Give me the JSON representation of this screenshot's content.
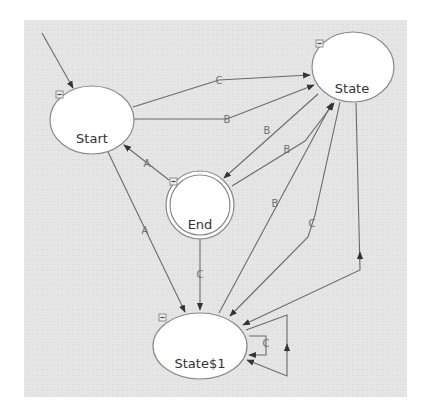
{
  "diagram": {
    "type": "state-machine",
    "colors": {
      "background": "#e6e6e6",
      "node_fill": "#ffffff",
      "node_stroke": "#8a8a8a",
      "edge": "#6a6a6a",
      "label": "#333333"
    },
    "nodes": [
      {
        "id": "start",
        "label": "Start",
        "kind": "initial",
        "collapse_icon": "minus-box-icon"
      },
      {
        "id": "state",
        "label": "State",
        "kind": "normal",
        "collapse_icon": "minus-box-icon"
      },
      {
        "id": "end",
        "label": "End",
        "kind": "final",
        "collapse_icon": "minus-box-icon"
      },
      {
        "id": "state1",
        "label": "State$1",
        "kind": "normal",
        "collapse_icon": "minus-box-icon"
      }
    ],
    "edges": [
      {
        "from": "start",
        "to": "state",
        "label": "C"
      },
      {
        "from": "start",
        "to": "state",
        "label": "B"
      },
      {
        "from": "state",
        "to": "end",
        "label": "B"
      },
      {
        "from": "end",
        "to": "state",
        "label": "B"
      },
      {
        "from": "end",
        "to": "start",
        "label": "A"
      },
      {
        "from": "start",
        "to": "state1",
        "label": "A"
      },
      {
        "from": "end",
        "to": "state1",
        "label": "C"
      },
      {
        "from": "state1",
        "to": "state",
        "label": "B"
      },
      {
        "from": "state",
        "to": "state1",
        "label": "C"
      },
      {
        "from": "state",
        "to": "state1",
        "label": ""
      },
      {
        "from": "state1",
        "to": "state1",
        "label": "C"
      },
      {
        "from": "state1",
        "to": "state1",
        "label": ""
      }
    ]
  }
}
